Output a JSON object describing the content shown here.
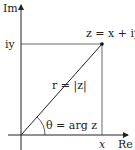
{
  "diagram": {
    "axes": {
      "vertical_label": "Im",
      "horizontal_label": "Re"
    },
    "labels": {
      "iy": "iy",
      "x": "x",
      "point": "z = x + iy",
      "modulus": "r = |z|",
      "angle": "θ = arg z"
    },
    "colors": {
      "line": "#222222",
      "guide": "#555555",
      "background": "#ffffff"
    }
  }
}
